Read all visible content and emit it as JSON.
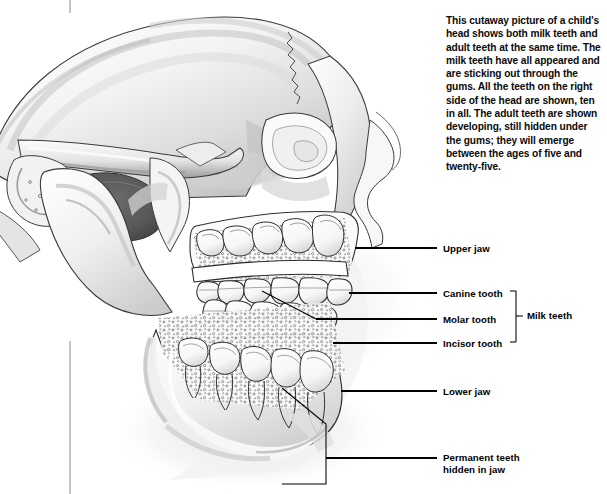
{
  "page": {
    "background_color": "#ffffff",
    "width": 607,
    "height": 494
  },
  "caption": {
    "name": "caption-text",
    "text": "This cutaway picture of a child's head shows both milk teeth and adult teeth at the same time. The milk teeth have all appeared and are sticking out through the gums. All the teeth on the right side of the head are shown, ten in all. The adult teeth are shown developing, still hidden under the gums; they will emerge between the ages of five and twenty-five.",
    "color": "#0a0a0a"
  },
  "labels": [
    {
      "id": "upper-jaw",
      "text": "Upper jaw",
      "x": 443,
      "y": 243
    },
    {
      "id": "canine-tooth",
      "text": "Canine tooth",
      "x": 443,
      "y": 288
    },
    {
      "id": "molar-tooth",
      "text": "Molar tooth",
      "x": 443,
      "y": 314
    },
    {
      "id": "incisor-tooth",
      "text": "Incisor tooth",
      "x": 443,
      "y": 338
    },
    {
      "id": "milk-teeth",
      "text": "Milk teeth",
      "x": 527,
      "y": 313
    },
    {
      "id": "lower-jaw",
      "text": "Lower jaw",
      "x": 443,
      "y": 386
    },
    {
      "id": "permanent-teeth",
      "text": "Permanent teeth\nhidden in jaw",
      "x": 443,
      "y": 452
    }
  ],
  "leader_lines": [
    {
      "id": "leader-upper-jaw",
      "points": "355,248 437,248"
    },
    {
      "id": "leader-canine-tooth",
      "points": "349,293 437,293"
    },
    {
      "id": "leader-molar-tooth",
      "points": "316,319 437,319"
    },
    {
      "id": "leader-incisor-tooth",
      "points": "333,343 437,343"
    },
    {
      "id": "leader-lower-jaw",
      "points": "341,391 437,391"
    },
    {
      "id": "leader-permanent-a",
      "points": "326,458 437,458"
    },
    {
      "id": "leader-permanent-b",
      "points": "326,458 326,458"
    }
  ],
  "pointer_lines": [
    {
      "id": "pointer-molar-to-tooth",
      "points": "316,319 263,292"
    },
    {
      "id": "pointer-permanent-branch-1",
      "points": "326,458 326,425 281,389"
    },
    {
      "id": "pointer-permanent-branch-2",
      "points": "326,458 326,484 281,484"
    }
  ],
  "bracket": {
    "id": "milk-teeth-bracket",
    "x": 516,
    "top": 291,
    "bottom": 342,
    "tick": 6,
    "stem_y": 316
  },
  "crop_marks": [
    {
      "id": "crop-mark-top",
      "x": 70,
      "y1": 0,
      "y2": 13
    },
    {
      "id": "crop-mark-bottom",
      "x": 70,
      "y1": 341,
      "y2": 494
    }
  ],
  "colors": {
    "ink": "#111111",
    "bone_light": "#fbfbfb",
    "bone_mid": "#d7d7d7",
    "bone_shade": "#9a9a9a",
    "bone_dark": "#6d6d6d",
    "cavity": "#5f5f5f",
    "outline": "#2b2b2b",
    "tooth": "#ffffff",
    "shadow": "#efefef"
  },
  "illustration": {
    "name": "child-skull-cutaway",
    "parts": [
      "cranium",
      "zygomatic-arch",
      "temporal-bone",
      "maxilla",
      "upper-jaw-cutaway",
      "mandible",
      "lower-jaw-cutaway",
      "milk-teeth-row-upper",
      "milk-teeth-row-lower",
      "permanent-tooth-buds-upper",
      "permanent-tooth-buds-lower",
      "nasal-profile",
      "chin",
      "neck-shadow"
    ],
    "milk_teeth_count": 10
  }
}
